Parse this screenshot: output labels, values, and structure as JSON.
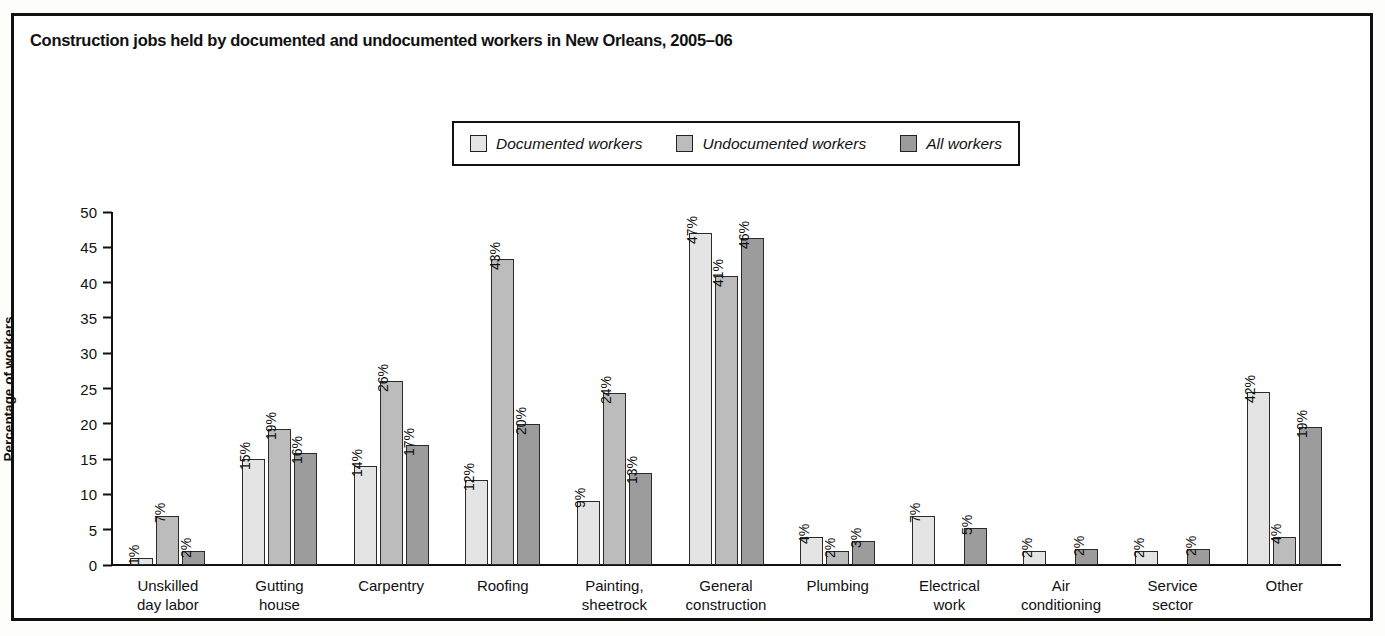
{
  "chart_data": {
    "type": "bar",
    "title": "Construction jobs held by documented and undocumented workers in New Orleans, 2005–06",
    "xlabel": "",
    "ylabel": "Percentage of workers",
    "ylim": [
      0,
      50
    ],
    "ytick_step": 5,
    "yticks": [
      "0",
      "5",
      "10",
      "15",
      "20",
      "25",
      "30",
      "35",
      "40",
      "45",
      "50"
    ],
    "grid": false,
    "legend_position": "top-center",
    "value_label_suffix": "%",
    "categories": [
      "Unskilled\nday labor",
      "Gutting\nhouse",
      "Carpentry",
      "Roofing",
      "Painting,\nsheetrock",
      "General\nconstruction",
      "Plumbing",
      "Electrical\nwork",
      "Air\nconditioning",
      "Service\nsector",
      "Other"
    ],
    "series": [
      {
        "name": "Documented workers",
        "color": "#e4e4e4",
        "values": [
          1,
          15,
          14,
          12,
          9,
          47,
          4,
          7,
          2,
          2,
          42
        ],
        "labels": [
          "1%",
          "15%",
          "14%",
          "12%",
          "9%",
          "47%",
          "4%",
          "7%",
          "2%",
          "2%",
          "42%"
        ],
        "drawn_heights": [
          1,
          15,
          14,
          12,
          9,
          47,
          4,
          7,
          2,
          2,
          24.5
        ]
      },
      {
        "name": "Undocumented workers",
        "color": "#bcbcbc",
        "values": [
          7,
          19,
          26,
          43,
          24,
          41,
          2,
          null,
          null,
          null,
          4
        ],
        "labels": [
          "7%",
          "19%",
          "26%",
          "43%",
          "24%",
          "41%",
          "2%",
          "",
          "",
          "",
          "4%"
        ],
        "drawn_heights": [
          7,
          19.3,
          26,
          43.3,
          24.3,
          41,
          2,
          null,
          null,
          null,
          4
        ]
      },
      {
        "name": "All workers",
        "color": "#9c9c9c",
        "values": [
          2,
          16,
          17,
          20,
          13,
          46,
          3,
          5,
          2,
          2,
          19
        ],
        "labels": [
          "2%",
          "16%",
          "17%",
          "20%",
          "13%",
          "46%",
          "3%",
          "5%",
          "2%",
          "2%",
          "19%"
        ],
        "drawn_heights": [
          2,
          15.8,
          17,
          20,
          13,
          46.3,
          3.4,
          5.3,
          2.2,
          2.2,
          19.5
        ]
      }
    ]
  },
  "legend": {
    "items": [
      {
        "label": "Documented workers",
        "swatch": "#e4e4e4"
      },
      {
        "label": "Undocumented workers",
        "swatch": "#bcbcbc"
      },
      {
        "label": "All workers",
        "swatch": "#9c9c9c"
      }
    ]
  },
  "colors": {
    "frame": "#111111",
    "axis": "#111111",
    "background": "#ffffff",
    "series_documented": "#e4e4e4",
    "series_undocumented": "#bcbcbc",
    "series_all": "#9c9c9c"
  }
}
